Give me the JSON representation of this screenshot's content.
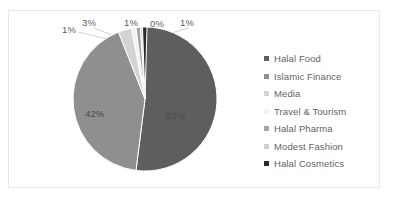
{
  "chart_data": {
    "type": "pie",
    "title": "",
    "legend_position": "right",
    "categories": [
      "Halal Food",
      "Islamic Finance",
      "Media",
      "Travel & Tourism",
      "Halal Pharma",
      "Modest Fashion",
      "Halal Cosmetics"
    ],
    "values": [
      52,
      42,
      3,
      1,
      1,
      0,
      1
    ],
    "data_labels": [
      "52%",
      "42%",
      "3%",
      "1%",
      "1%",
      "0%",
      "1%"
    ],
    "colors": [
      "#5e5e5e",
      "#8f8f8f",
      "#d4d4d4",
      "#f2f2f2",
      "#a6a6a6",
      "#cfcfcf",
      "#2b2b2b"
    ],
    "xlabel": "",
    "ylabel": ""
  },
  "frame": {
    "border_color": "#e8e8e8",
    "background": "#ffffff"
  },
  "labels": {
    "callout": [
      {
        "text": "1%",
        "left": "62px",
        "top": "24px"
      },
      {
        "text": "3%",
        "left": "82px",
        "top": "17px"
      },
      {
        "text": "1%",
        "left": "124px",
        "top": "17px"
      },
      {
        "text": "0%",
        "left": "150px",
        "top": "18px"
      },
      {
        "text": "1%",
        "left": "180px",
        "top": "17px"
      }
    ],
    "inner": [
      {
        "text": "42%",
        "left": "85px",
        "top": "108px"
      },
      {
        "text": "52%",
        "left": "166px",
        "top": "110px"
      }
    ]
  },
  "legend": {
    "items": [
      {
        "label": "Halal Food",
        "color": "#5e5e5e"
      },
      {
        "label": "Islamic Finance",
        "color": "#8f8f8f"
      },
      {
        "label": "Media",
        "color": "#d4d4d4"
      },
      {
        "label": "Travel & Tourism",
        "color": "#f2f2f2"
      },
      {
        "label": "Halal Pharma",
        "color": "#a6a6a6"
      },
      {
        "label": "Modest Fashion",
        "color": "#cfcfcf"
      },
      {
        "label": "Halal Cosmetics",
        "color": "#2b2b2b"
      }
    ]
  }
}
